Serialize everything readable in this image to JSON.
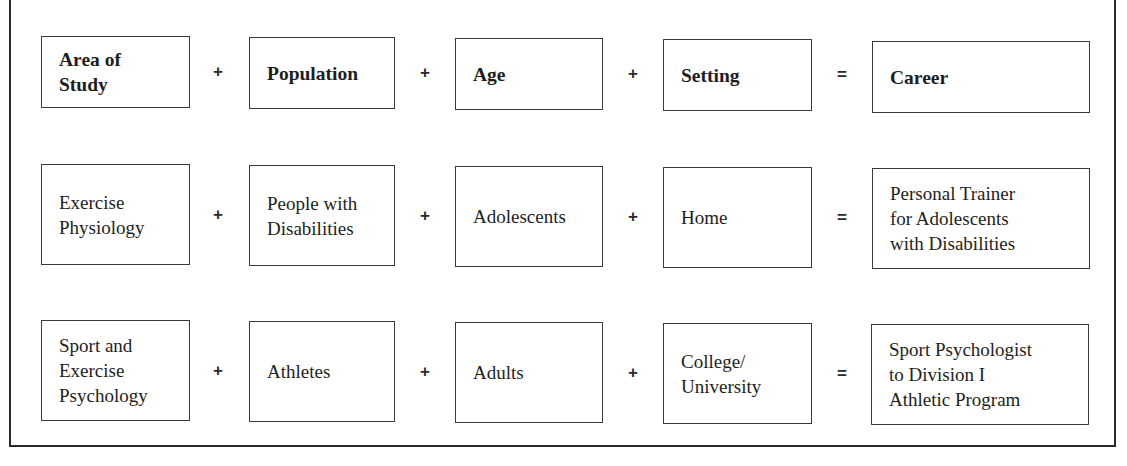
{
  "diagram": {
    "type": "career-equation",
    "operators": {
      "plus": "+",
      "equals": "="
    },
    "header_row": {
      "area_of_study": "Area of\nStudy",
      "population": "Population",
      "age": "Age",
      "setting": "Setting",
      "career": "Career"
    },
    "examples": [
      {
        "area_of_study": "Exercise\nPhysiology",
        "population": "People with\nDisabilities",
        "age": "Adolescents",
        "setting": "Home",
        "career": "Personal Trainer\nfor Adolescents\nwith Disabilities"
      },
      {
        "area_of_study": "Sport and\nExercise\nPsychology",
        "population": "Athletes",
        "age": "Adults",
        "setting": "College/\nUniversity",
        "career": "Sport Psychologist\nto Division I\nAthletic Program"
      }
    ]
  }
}
